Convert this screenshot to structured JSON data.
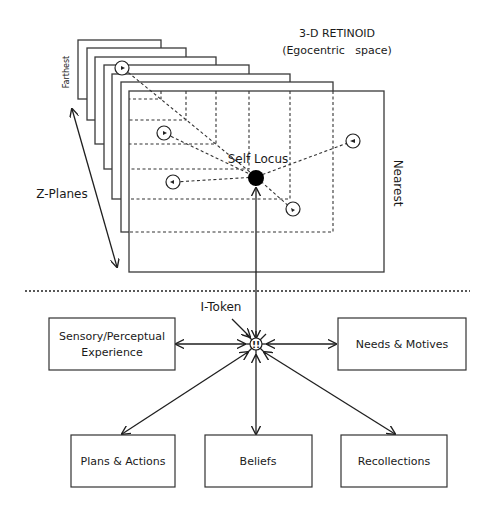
{
  "title": {
    "line1": "3-D RETINOID",
    "line2": "(Egocentric   space)"
  },
  "plane_labels": {
    "farthest": "Farthest",
    "nearest": "Nearest",
    "z_planes": "Z-Planes"
  },
  "self_locus": "Self Locus",
  "i_token": {
    "label": "I-Token",
    "glyph": "!!"
  },
  "boxes": {
    "sensory": {
      "line1": "Sensory/Perceptual",
      "line2": "Experience"
    },
    "needs": {
      "line1": "Needs & Motives"
    },
    "plans": {
      "line1": "Plans & Actions"
    },
    "beliefs": {
      "line1": "Beliefs"
    },
    "recollections": {
      "line1": "Recollections"
    }
  },
  "plane_count": 7,
  "colors": {
    "ink": "#1f1f1f",
    "background": "#ffffff"
  }
}
